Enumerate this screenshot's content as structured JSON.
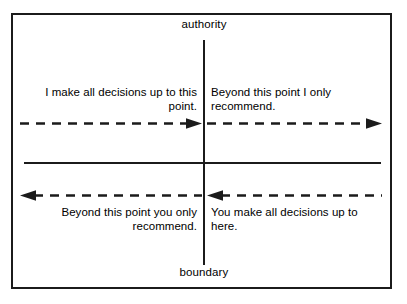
{
  "diagram": {
    "axes": {
      "vertical_top_label": "authority",
      "vertical_bottom_label": "boundary"
    },
    "quadrants": {
      "top_left": {
        "text": "I make all decisions up to this point.",
        "align": "right"
      },
      "top_right": {
        "text": "Beyond this point I only recommend.",
        "align": "left"
      },
      "bottom_left": {
        "text": "Beyond this point you only recommend.",
        "align": "right"
      },
      "bottom_right": {
        "text": "You make all decisions up to here.",
        "align": "left"
      }
    },
    "arrows": [
      {
        "name": "top-left-arrow",
        "direction": "right",
        "style": "dashed"
      },
      {
        "name": "top-right-arrow",
        "direction": "right",
        "style": "dashed"
      },
      {
        "name": "bottom-left-arrow",
        "direction": "left",
        "style": "dashed"
      },
      {
        "name": "bottom-right-arrow",
        "direction": "left",
        "style": "dashed"
      }
    ],
    "colors": {
      "line": "#1b1b1b",
      "text": "#000000",
      "background": "#ffffff"
    }
  }
}
